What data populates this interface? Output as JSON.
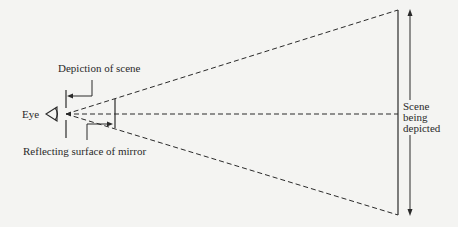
{
  "labels": {
    "eye": "Eye",
    "depiction": "Depiction of scene",
    "reflecting_surface": "Reflecting surface of mirror",
    "scene_line1": "Scene",
    "scene_line2": "being",
    "scene_line3": "depicted"
  },
  "colors": {
    "background": "#f4f4f2",
    "ink": "#2a2a2a"
  },
  "geometry": {
    "eye_point": [
      58,
      114
    ],
    "mirror_plane_x": 66,
    "reflecting_surface_x": 115,
    "scene_plane_x": 398,
    "scene_top_y": 10,
    "scene_bottom_y": 215,
    "center_y": 114
  }
}
